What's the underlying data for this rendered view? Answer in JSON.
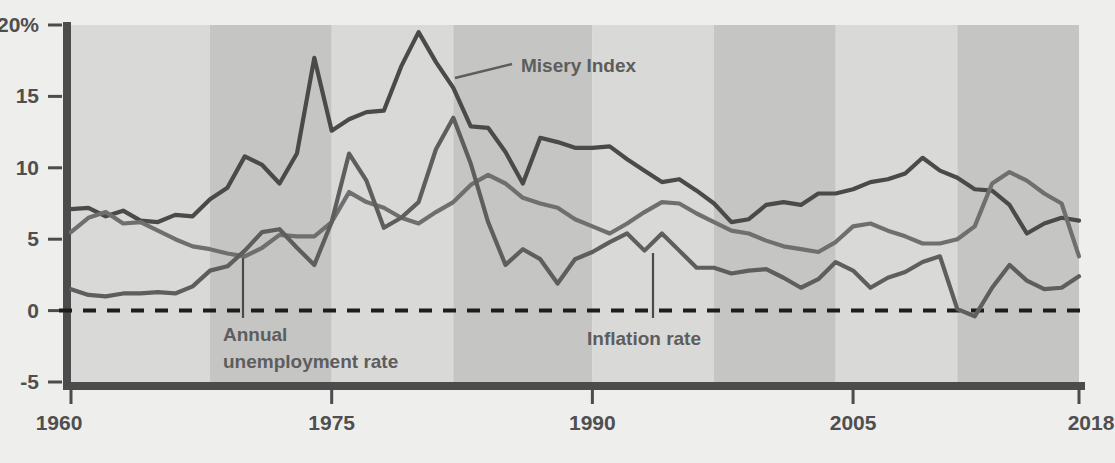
{
  "chart_data": {
    "type": "line",
    "title": "",
    "xlabel": "",
    "ylabel": "",
    "xlim": [
      1960,
      2018
    ],
    "ylim": [
      -5,
      20
    ],
    "grid": false,
    "zero_line": true,
    "legend_position": "inline-annotations",
    "y_ticks": [
      "20%",
      "15",
      "10",
      "5",
      "0",
      "-5"
    ],
    "y_tick_values": [
      20,
      15,
      10,
      5,
      0,
      -5
    ],
    "x_ticks": [
      "1960",
      "1975",
      "1990",
      "2005",
      "2018"
    ],
    "x_tick_values": [
      1960,
      1975,
      1990,
      2005,
      2018
    ],
    "x": [
      1960,
      1961,
      1962,
      1963,
      1964,
      1965,
      1966,
      1967,
      1968,
      1969,
      1970,
      1971,
      1972,
      1973,
      1974,
      1975,
      1976,
      1977,
      1978,
      1979,
      1980,
      1981,
      1982,
      1983,
      1984,
      1985,
      1986,
      1987,
      1988,
      1989,
      1990,
      1991,
      1992,
      1993,
      1994,
      1995,
      1996,
      1997,
      1998,
      1999,
      2000,
      2001,
      2002,
      2003,
      2004,
      2005,
      2006,
      2007,
      2008,
      2009,
      2010,
      2011,
      2012,
      2013,
      2014,
      2015,
      2016,
      2017,
      2018
    ],
    "series": [
      {
        "name": "Misery Index",
        "color": "#4a4a4a",
        "values": [
          7.1,
          7.2,
          6.6,
          7.0,
          6.3,
          6.2,
          6.7,
          6.6,
          7.8,
          8.6,
          10.8,
          10.2,
          8.9,
          11.0,
          17.7,
          12.6,
          13.4,
          13.9,
          14.0,
          17.1,
          19.5,
          17.4,
          15.6,
          12.9,
          12.8,
          11.1,
          8.9,
          12.1,
          11.8,
          11.4,
          11.4,
          11.5,
          10.6,
          9.8,
          9.0,
          9.2,
          8.4,
          7.5,
          6.2,
          6.4,
          7.4,
          7.6,
          7.4,
          8.2,
          8.2,
          8.5,
          9.0,
          9.2,
          9.6,
          10.7,
          9.8,
          9.3,
          8.5,
          8.4,
          7.4,
          5.4,
          6.1,
          6.5,
          6.3
        ]
      },
      {
        "name": "Annual unemployment rate",
        "color": "#6f6f6f",
        "values": [
          5.5,
          6.5,
          6.9,
          6.1,
          6.2,
          5.6,
          5.0,
          4.5,
          4.3,
          4.0,
          3.8,
          4.4,
          5.3,
          5.2,
          5.2,
          6.2,
          8.3,
          7.6,
          7.2,
          6.5,
          6.1,
          6.9,
          7.6,
          8.8,
          9.5,
          8.9,
          7.9,
          7.5,
          7.2,
          6.4,
          5.9,
          5.4,
          6.1,
          6.9,
          7.6,
          7.5,
          6.8,
          6.2,
          5.6,
          5.4,
          4.9,
          4.5,
          4.3,
          4.1,
          4.8,
          5.9,
          6.1,
          5.6,
          5.2,
          4.7,
          4.7,
          5.0,
          5.9,
          8.9,
          9.7,
          9.1,
          8.2,
          7.5,
          3.8
        ]
      },
      {
        "name": "Inflation rate",
        "color": "#5e5e5e",
        "values": [
          1.5,
          1.1,
          1.0,
          1.2,
          1.2,
          1.3,
          1.2,
          1.7,
          2.8,
          3.1,
          4.2,
          5.5,
          5.7,
          4.4,
          3.2,
          6.2,
          11.0,
          9.1,
          5.8,
          6.5,
          7.6,
          11.3,
          13.5,
          10.3,
          6.2,
          3.2,
          4.3,
          3.6,
          1.9,
          3.6,
          4.1,
          4.8,
          5.4,
          4.2,
          5.4,
          4.2,
          3.0,
          3.0,
          2.6,
          2.8,
          2.9,
          2.3,
          1.6,
          2.2,
          3.4,
          2.8,
          1.6,
          2.3,
          2.7,
          3.4,
          3.8,
          0.1,
          -0.4,
          1.6,
          3.2,
          2.1,
          1.5,
          1.6,
          2.4
        ]
      }
    ],
    "annotations": [
      {
        "text": "Misery Index",
        "name": "misery-index-annotation"
      },
      {
        "text": "Annual",
        "name": "unemployment-annotation-line1"
      },
      {
        "text": "unemployment rate",
        "name": "unemployment-annotation-line2"
      },
      {
        "text": "Inflation rate",
        "name": "inflation-annotation"
      }
    ],
    "background_bands": [
      {
        "from": 1960,
        "to": 1968,
        "shade": "light"
      },
      {
        "from": 1968,
        "to": 1975,
        "shade": "dark"
      },
      {
        "from": 1975,
        "to": 1982,
        "shade": "light"
      },
      {
        "from": 1982,
        "to": 1990,
        "shade": "dark"
      },
      {
        "from": 1990,
        "to": 1997,
        "shade": "light"
      },
      {
        "from": 1997,
        "to": 2004,
        "shade": "dark"
      },
      {
        "from": 2004,
        "to": 2011,
        "shade": "light"
      },
      {
        "from": 2011,
        "to": 2018,
        "shade": "dark"
      }
    ],
    "colors": {
      "band_light": "#d9d9d7",
      "band_dark": "#c5c5c3",
      "page_background": "#eeeeec",
      "axis": "#4c4c4c",
      "tick_text": "#4f4f4f",
      "annotation_text": "#5d5d5d",
      "zero_line": "#1d1d1d"
    }
  }
}
